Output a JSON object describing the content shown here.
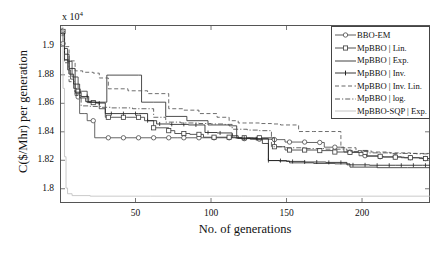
{
  "chart_data": {
    "type": "line",
    "title": "",
    "xlabel": "No. of generations",
    "ylabel": "C($/Mhr) per generation",
    "y_exponent_label": "x 10",
    "y_exponent_power": "4",
    "xlim": [
      0,
      245
    ],
    "ylim": [
      1.79,
      1.915
    ],
    "xticks": [
      50,
      100,
      150,
      200
    ],
    "yticks": [
      1.8,
      1.82,
      1.84,
      1.86,
      1.88,
      1.9
    ],
    "xtick_labels": [
      "50",
      "100",
      "150",
      "200"
    ],
    "ytick_labels": [
      "1.8",
      "1.82",
      "1.84",
      "1.86",
      "1.88",
      "1.9"
    ],
    "grid": false,
    "legend_position": "top-right",
    "series": [
      {
        "name": "BBO-EM",
        "style": "solid",
        "marker": "circle",
        "color": "#4a4a4a",
        "points": [
          [
            1,
            1.9125
          ],
          [
            2,
            1.902
          ],
          [
            3,
            1.8905
          ],
          [
            5,
            1.8835
          ],
          [
            7,
            1.877
          ],
          [
            9,
            1.8705
          ],
          [
            11,
            1.8645
          ],
          [
            13,
            1.8528
          ],
          [
            16,
            1.8528
          ],
          [
            18,
            1.8478
          ],
          [
            21,
            1.8478
          ],
          [
            23,
            1.8358
          ],
          [
            40,
            1.8358
          ],
          [
            63,
            1.8358
          ],
          [
            78,
            1.8358
          ],
          [
            92,
            1.8358
          ],
          [
            112,
            1.8358
          ],
          [
            121,
            1.8352
          ],
          [
            131,
            1.8348
          ],
          [
            141,
            1.8345
          ],
          [
            149,
            1.8328
          ],
          [
            163,
            1.8325
          ],
          [
            175,
            1.8292
          ],
          [
            188,
            1.8258
          ],
          [
            198,
            1.8232
          ],
          [
            212,
            1.8225
          ],
          [
            226,
            1.8218
          ],
          [
            240,
            1.8212
          ],
          [
            245,
            1.8212
          ]
        ]
      },
      {
        "name": "MpBBO | Lin.",
        "style": "solid",
        "marker": "square",
        "color": "#3c3c3c",
        "points": [
          [
            1,
            1.9105
          ],
          [
            3,
            1.8985
          ],
          [
            5,
            1.8895
          ],
          [
            8,
            1.8785
          ],
          [
            12,
            1.8685
          ],
          [
            14,
            1.8685
          ],
          [
            18,
            1.8605
          ],
          [
            22,
            1.8605
          ],
          [
            26,
            1.8562
          ],
          [
            30,
            1.8502
          ],
          [
            44,
            1.8502
          ],
          [
            56,
            1.8478
          ],
          [
            62,
            1.8428
          ],
          [
            72,
            1.8408
          ],
          [
            76,
            1.8388
          ],
          [
            86,
            1.8382
          ],
          [
            95,
            1.8362
          ],
          [
            106,
            1.8362
          ],
          [
            116,
            1.8358
          ],
          [
            124,
            1.8358
          ],
          [
            135,
            1.8358
          ],
          [
            142,
            1.8295
          ],
          [
            149,
            1.8272
          ],
          [
            160,
            1.8272
          ],
          [
            172,
            1.8268
          ],
          [
            182,
            1.8258
          ],
          [
            192,
            1.8255
          ],
          [
            203,
            1.8228
          ],
          [
            214,
            1.8222
          ],
          [
            228,
            1.8218
          ],
          [
            238,
            1.8212
          ],
          [
            245,
            1.8212
          ]
        ]
      },
      {
        "name": "MpBBO | Exp.",
        "style": "solid",
        "marker": "none",
        "color": "#2e2e2e",
        "points": [
          [
            1,
            1.9095
          ],
          [
            3,
            1.8905
          ],
          [
            6,
            1.8805
          ],
          [
            9,
            1.8735
          ],
          [
            13,
            1.8638
          ],
          [
            17,
            1.8612
          ],
          [
            21,
            1.8608
          ],
          [
            26,
            1.8608
          ],
          [
            31,
            1.8798
          ],
          [
            33,
            1.8798
          ],
          [
            52,
            1.8798
          ],
          [
            54,
            1.8608
          ],
          [
            62,
            1.8608
          ],
          [
            70,
            1.8508
          ],
          [
            84,
            1.8478
          ],
          [
            98,
            1.8448
          ],
          [
            112,
            1.8442
          ],
          [
            117,
            1.8355
          ],
          [
            126,
            1.8348
          ],
          [
            134,
            1.8318
          ],
          [
            138,
            1.8198
          ],
          [
            145,
            1.8195
          ],
          [
            152,
            1.8182
          ],
          [
            168,
            1.8178
          ],
          [
            182,
            1.8175
          ],
          [
            192,
            1.8152
          ],
          [
            210,
            1.8148
          ],
          [
            230,
            1.8148
          ],
          [
            245,
            1.8148
          ]
        ]
      },
      {
        "name": "MpBBO | Inv.",
        "style": "solid",
        "marker": "dot",
        "color": "#222222",
        "points": [
          [
            1,
            1.9088
          ],
          [
            3,
            1.8945
          ],
          [
            6,
            1.8845
          ],
          [
            10,
            1.8678
          ],
          [
            14,
            1.8648
          ],
          [
            19,
            1.8608
          ],
          [
            24,
            1.8602
          ],
          [
            30,
            1.8528
          ],
          [
            42,
            1.8528
          ],
          [
            52,
            1.8528
          ],
          [
            58,
            1.8478
          ],
          [
            64,
            1.8455
          ],
          [
            73,
            1.8452
          ],
          [
            85,
            1.8448
          ],
          [
            96,
            1.8395
          ],
          [
            104,
            1.8392
          ],
          [
            114,
            1.8372
          ],
          [
            118,
            1.8355
          ],
          [
            128,
            1.8352
          ],
          [
            138,
            1.8198
          ],
          [
            150,
            1.8192
          ],
          [
            162,
            1.8188
          ],
          [
            176,
            1.8185
          ],
          [
            190,
            1.8168
          ],
          [
            205,
            1.8165
          ],
          [
            222,
            1.8165
          ],
          [
            240,
            1.8165
          ],
          [
            245,
            1.8165
          ]
        ]
      },
      {
        "name": "MpBBO | Inv. Lin.",
        "style": "dashed",
        "marker": "none",
        "color": "#555555",
        "points": [
          [
            1,
            1.9108
          ],
          [
            3,
            1.8998
          ],
          [
            6,
            1.8898
          ],
          [
            10,
            1.8828
          ],
          [
            15,
            1.8818
          ],
          [
            22,
            1.8812
          ],
          [
            26,
            1.8778
          ],
          [
            32,
            1.8702
          ],
          [
            45,
            1.8688
          ],
          [
            58,
            1.8668
          ],
          [
            66,
            1.8668
          ],
          [
            72,
            1.8562
          ],
          [
            82,
            1.8552
          ],
          [
            92,
            1.8528
          ],
          [
            104,
            1.8502
          ],
          [
            112,
            1.8478
          ],
          [
            118,
            1.8462
          ],
          [
            122,
            1.8462
          ],
          [
            132,
            1.8458
          ],
          [
            140,
            1.8455
          ],
          [
            146,
            1.8448
          ],
          [
            158,
            1.8402
          ],
          [
            168,
            1.8402
          ],
          [
            178,
            1.8402
          ],
          [
            186,
            1.8288
          ],
          [
            196,
            1.8268
          ],
          [
            206,
            1.8258
          ],
          [
            218,
            1.8252
          ],
          [
            232,
            1.8248
          ],
          [
            245,
            1.8248
          ]
        ]
      },
      {
        "name": "MpBBO | log.",
        "style": "dashdot",
        "marker": "none",
        "color": "#4d4d4d",
        "points": [
          [
            1,
            1.9075
          ],
          [
            3,
            1.8885
          ],
          [
            6,
            1.8752
          ],
          [
            10,
            1.8655
          ],
          [
            14,
            1.8582
          ],
          [
            20,
            1.8578
          ],
          [
            27,
            1.8572
          ],
          [
            34,
            1.8568
          ],
          [
            48,
            1.8562
          ],
          [
            62,
            1.8502
          ],
          [
            70,
            1.8468
          ],
          [
            80,
            1.8462
          ],
          [
            92,
            1.8458
          ],
          [
            100,
            1.8455
          ],
          [
            108,
            1.8452
          ],
          [
            114,
            1.8418
          ],
          [
            124,
            1.8412
          ],
          [
            132,
            1.8408
          ],
          [
            140,
            1.8295
          ],
          [
            150,
            1.8288
          ],
          [
            162,
            1.8282
          ],
          [
            176,
            1.8278
          ],
          [
            190,
            1.8262
          ],
          [
            204,
            1.8252
          ],
          [
            220,
            1.8248
          ],
          [
            236,
            1.8245
          ],
          [
            245,
            1.8245
          ]
        ]
      },
      {
        "name": "MpBBO-SQP | Exp.",
        "style": "solid-light",
        "marker": "none",
        "color": "#bdbdbd",
        "points": [
          [
            1,
            1.9135
          ],
          [
            2,
            1.8705
          ],
          [
            3,
            1.8225
          ],
          [
            4,
            1.8005
          ],
          [
            5,
            1.7965
          ],
          [
            8,
            1.7952
          ],
          [
            20,
            1.7948
          ],
          [
            60,
            1.7948
          ],
          [
            120,
            1.7948
          ],
          [
            180,
            1.7948
          ],
          [
            245,
            1.7948
          ]
        ]
      }
    ]
  },
  "legend": {
    "entries": [
      "BBO-EM",
      "MpBBO | Lin.",
      "MpBBO | Exp.",
      "MpBBO | Inv.",
      "MpBBO | Inv. Lin.",
      "MpBBO | log.",
      "MpBBO-SQP | Exp."
    ]
  }
}
